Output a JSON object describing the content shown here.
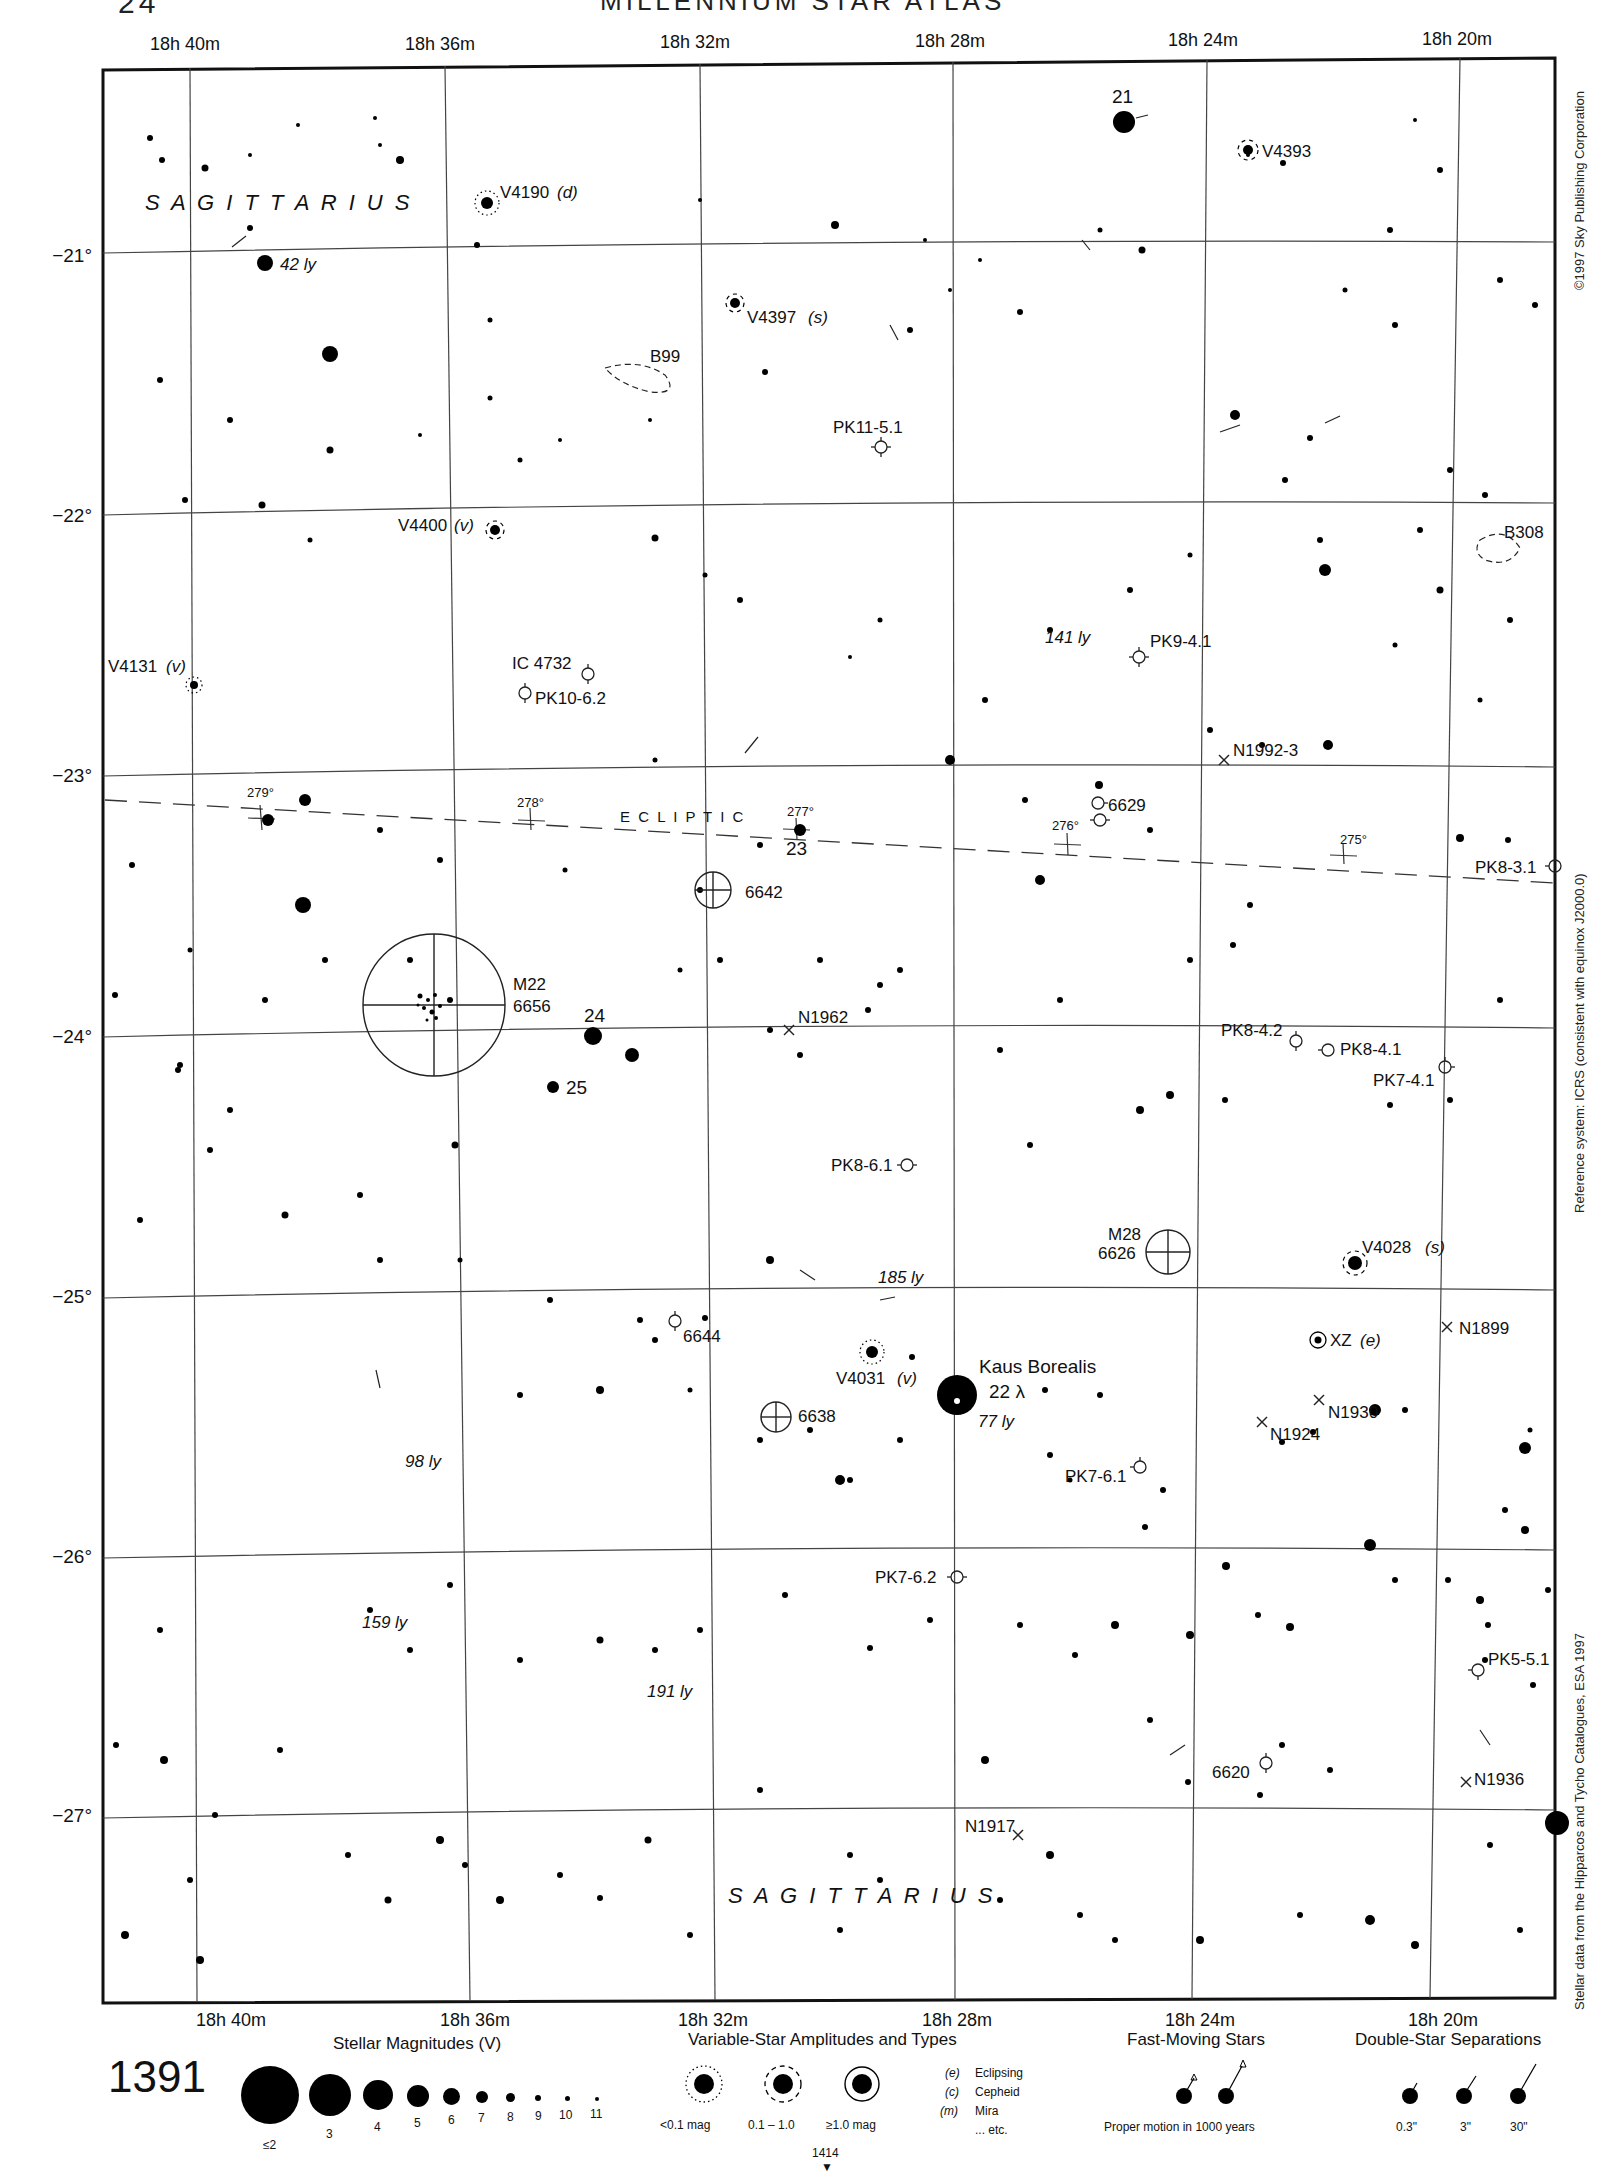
{
  "header": {
    "page_number": "24",
    "atlas_title": "MILLENNIUM STAR ATLAS"
  },
  "grid": {
    "ra_labels_top": [
      "18h 40m",
      "18h 36m",
      "18h 32m",
      "18h 28m",
      "18h 24m",
      "18h 20m"
    ],
    "ra_labels_bottom": [
      "18h 40m",
      "18h 36m",
      "18h 32m",
      "18h 28m",
      "18h 24m",
      "18h 20m"
    ],
    "dec_labels": [
      "−21°",
      "−22°",
      "−23°",
      "−24°",
      "−25°",
      "−26°",
      "−27°"
    ]
  },
  "constellation": {
    "name_top": "S A G I T T A R I U S",
    "name_bottom": "S A G I T T A R I U S"
  },
  "ecliptic": {
    "label": "E C L I P T I C",
    "longitudes": [
      "279°",
      "278°",
      "277°",
      "276°",
      "275°"
    ]
  },
  "labels": {
    "star_21": "21",
    "star_23": "23",
    "star_24": "24",
    "star_25": "25",
    "kaus_borealis": "Kaus Borealis",
    "kaus_designation": "22 λ",
    "kaus_distance": "77 ly",
    "v4190": "V4190",
    "v4190_type": "(d)",
    "v4393": "V4393",
    "v4397": "V4397",
    "v4397_type": "(s)",
    "v4400": "V4400",
    "v4400_type": "(v)",
    "v4131": "V4131",
    "v4131_type": "(v)",
    "v4031": "V4031",
    "v4031_type": "(v)",
    "v4028": "V4028",
    "v4028_type": "(s)",
    "xz": "XZ",
    "xz_type": "(e)",
    "b99": "B99",
    "b308": "B308",
    "pk11": "PK11-5.1",
    "pk9": "PK9-4.1",
    "pk10": "PK10-6.2",
    "ic4732": "IC 4732",
    "pk8_3_1": "PK8-3.1",
    "pk8_4_2": "PK8-4.2",
    "pk8_4_1": "PK8-4.1",
    "pk7_4_1": "PK7-4.1",
    "pk8_6_1": "PK8-6.1",
    "pk7_6_1": "PK7-6.1",
    "pk7_6_2": "PK7-6.2",
    "pk5_5_1": "PK5-5.1",
    "n1992": "N1992-3",
    "n1962": "N1962",
    "n1899": "N1899",
    "n1930": "N1930",
    "n1924": "N1924",
    "n1936": "N1936",
    "n1917": "N1917",
    "m22": "M22",
    "m22_ngc": "6656",
    "m28": "M28",
    "m28_ngc": "6626",
    "ngc6642": "6642",
    "ngc6638": "6638",
    "ngc6629": "6629",
    "ngc6644": "6644",
    "ngc6620": "6620",
    "dist_42": "42 ly",
    "dist_141": "141 ly",
    "dist_185": "185 ly",
    "dist_98": "98 ly",
    "dist_159": "159 ly",
    "dist_191": "191 ly"
  },
  "side_text": {
    "copyright": "©1997 Sky Publishing Corporation",
    "reference": "Reference system: ICRS (consistent with equinox J2000.0)",
    "data_source": "Stellar data from the Hipparcos and Tycho Catalogues, ESA 1997"
  },
  "legend": {
    "chart_number": "1391",
    "magnitudes_title": "Stellar Magnitudes (V)",
    "magnitudes": [
      "≤2",
      "3",
      "4",
      "5",
      "6",
      "7",
      "8",
      "9",
      "10",
      "11"
    ],
    "variables_title": "Variable-Star Amplitudes and Types",
    "variable_amplitudes": [
      "<0.1 mag",
      "0.1 – 1.0",
      "≥1.0 mag"
    ],
    "variable_types": [
      {
        "code": "(e)",
        "name": "Eclipsing"
      },
      {
        "code": "(c)",
        "name": "Cepheid"
      },
      {
        "code": "(m)",
        "name": "Mira"
      },
      {
        "code": "",
        "name": "... etc."
      }
    ],
    "adjacent_chart": "1414",
    "fast_title": "Fast-Moving Stars",
    "fast_caption": "Proper motion in 1000 years",
    "double_title": "Double-Star Separations",
    "double_separations": [
      "0.3\"",
      "3\"",
      "30\""
    ]
  }
}
